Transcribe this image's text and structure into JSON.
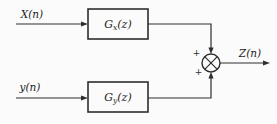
{
  "figure": {
    "background_color": "#fbfbfb",
    "line_color": "#2e2e2e",
    "text_color": "#1c1c1c",
    "inputs": [
      {
        "id": "x",
        "label": "X(n)"
      },
      {
        "id": "y",
        "label": "y(n)"
      }
    ],
    "blocks": [
      {
        "id": "gx",
        "name": "G",
        "subscript": "x",
        "argument": "(z)"
      },
      {
        "id": "gy",
        "name": "G",
        "subscript": "y",
        "argument": "(z)"
      }
    ],
    "summer": {
      "icon": "circle-times-junction-icon",
      "sign_top": "+",
      "sign_bottom": "+"
    },
    "output": {
      "label": "Z(n)"
    }
  }
}
